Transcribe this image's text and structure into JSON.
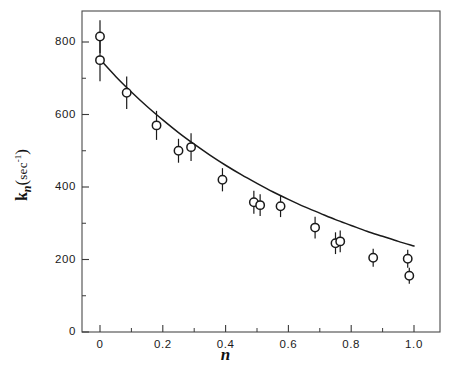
{
  "chart_data": {
    "type": "scatter",
    "title": "",
    "subtitle": "",
    "xlabel": "n",
    "ylabel": "k_n(sec^-1)",
    "ylabel_parts": {
      "symbol": "k",
      "subscript": "n",
      "units": "sec",
      "units_exponent": "-1"
    },
    "xlim": [
      -0.06,
      1.14
    ],
    "ylim": [
      0,
      890
    ],
    "xticks": [
      0,
      0.2,
      0.4,
      0.6,
      0.8,
      1.0
    ],
    "xtick_labels": [
      "0",
      "0.2",
      "0.4",
      "0.6",
      "0.8",
      "1.0"
    ],
    "xminor_ticks": [
      0.1,
      0.3,
      0.5,
      0.7,
      0.9
    ],
    "yticks": [
      0,
      200,
      400,
      600,
      800
    ],
    "ytick_labels": [
      "0",
      "200",
      "400",
      "600",
      "800"
    ],
    "yminor_ticks": [
      100,
      300,
      500,
      700
    ],
    "grid": false,
    "legend": null,
    "legend_position": "none",
    "marker": "open-circle",
    "marker_size": 7,
    "line_color": "#1a1a1a",
    "marker_color": "#1a1a1a",
    "errorbar_color": "#1a1a1a",
    "x": [
      0.0,
      0.0,
      0.085,
      0.18,
      0.25,
      0.29,
      0.39,
      0.49,
      0.51,
      0.575,
      0.685,
      0.75,
      0.765,
      0.87,
      0.98,
      0.985
    ],
    "y": [
      815,
      750,
      660,
      570,
      500,
      510,
      420,
      358,
      350,
      347,
      288,
      245,
      250,
      205,
      202,
      155
    ],
    "yerr": [
      45,
      58,
      45,
      40,
      33,
      38,
      32,
      32,
      30,
      30,
      30,
      30,
      30,
      25,
      25,
      22
    ],
    "points": [
      {
        "n": 0.0,
        "k": 815,
        "err": 45
      },
      {
        "n": 0.0,
        "k": 750,
        "err": 58
      },
      {
        "n": 0.085,
        "k": 660,
        "err": 45
      },
      {
        "n": 0.18,
        "k": 570,
        "err": 40
      },
      {
        "n": 0.25,
        "k": 500,
        "err": 33
      },
      {
        "n": 0.29,
        "k": 510,
        "err": 38
      },
      {
        "n": 0.39,
        "k": 420,
        "err": 32
      },
      {
        "n": 0.49,
        "k": 358,
        "err": 32
      },
      {
        "n": 0.51,
        "k": 350,
        "err": 30
      },
      {
        "n": 0.575,
        "k": 347,
        "err": 30
      },
      {
        "n": 0.685,
        "k": 288,
        "err": 30
      },
      {
        "n": 0.75,
        "k": 245,
        "err": 30
      },
      {
        "n": 0.765,
        "k": 250,
        "err": 30
      },
      {
        "n": 0.87,
        "k": 205,
        "err": 25
      },
      {
        "n": 0.98,
        "k": 202,
        "err": 25
      },
      {
        "n": 0.985,
        "k": 155,
        "err": 22
      }
    ],
    "fit_curve": {
      "description": "smooth decaying fit through data",
      "x": [
        0.0,
        0.05,
        0.1,
        0.15,
        0.2,
        0.25,
        0.3,
        0.35,
        0.4,
        0.45,
        0.5,
        0.55,
        0.6,
        0.65,
        0.7,
        0.75,
        0.8,
        0.85,
        0.9,
        0.95,
        1.0
      ],
      "y": [
        752,
        705,
        662,
        622,
        585,
        550,
        518,
        488,
        460,
        434,
        410,
        387,
        366,
        346,
        328,
        310,
        294,
        278,
        264,
        250,
        237
      ]
    }
  },
  "axes": {
    "xtitle": "n",
    "ytitle_symbol": "k",
    "ytitle_subscript": "n",
    "ytitle_units": "sec",
    "ytitle_units_exp": "-1",
    "ytick_labels": [
      "800",
      "600",
      "400",
      "200",
      "0"
    ],
    "xtick_labels": [
      "0",
      "0.2",
      "0.4",
      "0.6",
      "0.8",
      "1.0"
    ]
  }
}
